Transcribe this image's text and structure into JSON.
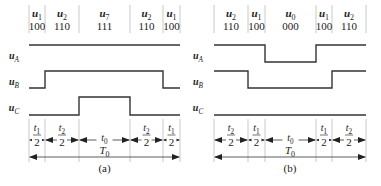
{
  "panels": [
    {
      "id": "a",
      "caption": "(a)",
      "vectors": [
        {
          "name": "u",
          "sub": "1",
          "code": "100"
        },
        {
          "name": "u",
          "sub": "2",
          "code": "110"
        },
        {
          "name": "u",
          "sub": "7",
          "code": "111"
        },
        {
          "name": "u",
          "sub": "2",
          "code": "110"
        },
        {
          "name": "u",
          "sub": "1",
          "code": "100"
        }
      ],
      "signals": [
        {
          "name": "u",
          "sub": "A",
          "levels": [
            1,
            1,
            1,
            1,
            1
          ]
        },
        {
          "name": "u",
          "sub": "B",
          "levels": [
            0,
            1,
            1,
            1,
            0
          ]
        },
        {
          "name": "u",
          "sub": "C",
          "levels": [
            0,
            0,
            1,
            0,
            0
          ]
        }
      ],
      "intervals": [
        {
          "num": "t",
          "num_sub": "1",
          "den": "2"
        },
        {
          "num": "t",
          "num_sub": "2",
          "den": "2"
        },
        {
          "num": "t",
          "num_sub": "0",
          "den": ""
        },
        {
          "num": "t",
          "num_sub": "2",
          "den": "2"
        },
        {
          "num": "t",
          "num_sub": "1",
          "den": "2"
        }
      ],
      "period": {
        "label": "T",
        "sub": "0"
      }
    },
    {
      "id": "b",
      "caption": "(b)",
      "vectors": [
        {
          "name": "u",
          "sub": "2",
          "code": "110"
        },
        {
          "name": "u",
          "sub": "1",
          "code": "100"
        },
        {
          "name": "u",
          "sub": "0",
          "code": "000"
        },
        {
          "name": "u",
          "sub": "1",
          "code": "100"
        },
        {
          "name": "u",
          "sub": "2",
          "code": "110"
        }
      ],
      "signals": [
        {
          "name": "u",
          "sub": "A",
          "levels": [
            1,
            1,
            0,
            1,
            1
          ]
        },
        {
          "name": "u",
          "sub": "B",
          "levels": [
            1,
            0,
            0,
            0,
            1
          ]
        },
        {
          "name": "u",
          "sub": "C",
          "levels": [
            0,
            0,
            0,
            0,
            0
          ]
        }
      ],
      "intervals": [
        {
          "num": "t",
          "num_sub": "2",
          "den": "2"
        },
        {
          "num": "t",
          "num_sub": "1",
          "den": "2"
        },
        {
          "num": "t",
          "num_sub": "0",
          "den": ""
        },
        {
          "num": "t",
          "num_sub": "1",
          "den": "2"
        },
        {
          "num": "t",
          "num_sub": "2",
          "den": "2"
        }
      ],
      "period": {
        "label": "T",
        "sub": "0"
      }
    }
  ],
  "colors": {
    "line": "#333333",
    "text": "#222222",
    "guide": "#bbbbbb"
  }
}
